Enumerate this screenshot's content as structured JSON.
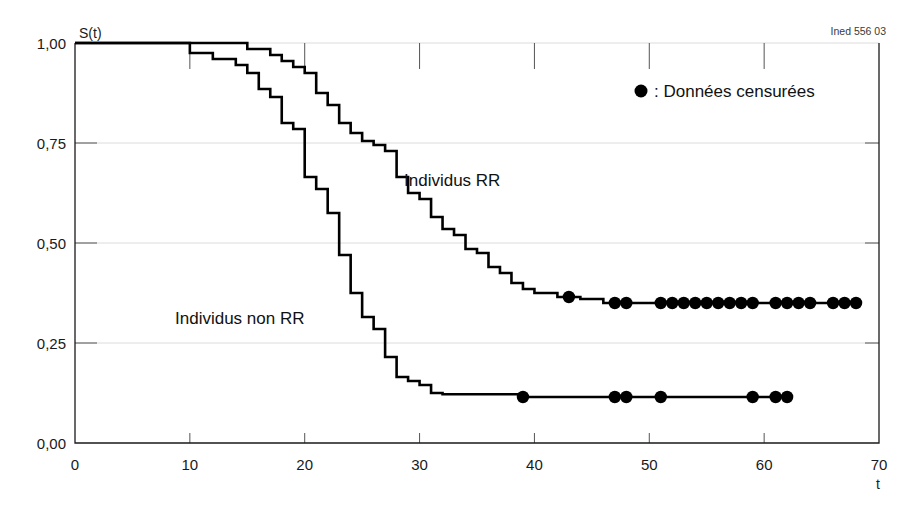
{
  "credit": "Ined 556 03",
  "legend": {
    "marker_icon": "filled-circle-icon",
    "text": ": Données censurées"
  },
  "series_labels": {
    "rr": "Individus RR",
    "non_rr": "Individus non RR"
  },
  "axes": {
    "y_title": "S(t)",
    "x_title": "t",
    "y_ticks": [
      "0,00",
      "0,25",
      "0,50",
      "0,75",
      "1,00"
    ],
    "x_ticks": [
      "0",
      "10",
      "20",
      "30",
      "40",
      "50",
      "60",
      "70"
    ]
  },
  "chart_data": {
    "type": "line",
    "title": "",
    "subtitle": "",
    "xlabel": "t",
    "ylabel": "S(t)",
    "xlim": [
      0,
      70
    ],
    "ylim": [
      0,
      1
    ],
    "grid": true,
    "legend_position": "top-right",
    "annotations": [
      {
        "text": "Individus RR",
        "x": 27.5,
        "y": 0.685
      },
      {
        "text": "Individus non RR",
        "x": 13.5,
        "y": 0.305
      },
      {
        "text": "Ined 556 03",
        "x": 68,
        "y": 1.02
      }
    ],
    "y_tick_values": [
      0,
      0.25,
      0.5,
      0.75,
      1.0
    ],
    "y_tick_labels": [
      "0,00",
      "0,25",
      "0,50",
      "0,75",
      "1,00"
    ],
    "x_tick_values": [
      0,
      10,
      20,
      30,
      40,
      50,
      60,
      70
    ],
    "x_tick_labels": [
      "0",
      "10",
      "20",
      "30",
      "40",
      "50",
      "60",
      "70"
    ],
    "series": [
      {
        "name": "Individus RR",
        "style": "step-post",
        "steps": [
          [
            0,
            1.0
          ],
          [
            15,
            1.0
          ],
          [
            15,
            0.985
          ],
          [
            17,
            0.985
          ],
          [
            17,
            0.97
          ],
          [
            18,
            0.97
          ],
          [
            18,
            0.955
          ],
          [
            19,
            0.955
          ],
          [
            19,
            0.94
          ],
          [
            20,
            0.94
          ],
          [
            20,
            0.925
          ],
          [
            21,
            0.925
          ],
          [
            21,
            0.875
          ],
          [
            22,
            0.875
          ],
          [
            22,
            0.845
          ],
          [
            23,
            0.845
          ],
          [
            23,
            0.8
          ],
          [
            24,
            0.8
          ],
          [
            24,
            0.775
          ],
          [
            25,
            0.775
          ],
          [
            25,
            0.755
          ],
          [
            26,
            0.755
          ],
          [
            26,
            0.745
          ],
          [
            27,
            0.745
          ],
          [
            27,
            0.73
          ],
          [
            28,
            0.73
          ],
          [
            28,
            0.665
          ],
          [
            29,
            0.665
          ],
          [
            29,
            0.625
          ],
          [
            30,
            0.625
          ],
          [
            30,
            0.61
          ],
          [
            31,
            0.61
          ],
          [
            31,
            0.565
          ],
          [
            32,
            0.565
          ],
          [
            32,
            0.535
          ],
          [
            33,
            0.535
          ],
          [
            33,
            0.52
          ],
          [
            34,
            0.52
          ],
          [
            34,
            0.485
          ],
          [
            35,
            0.485
          ],
          [
            35,
            0.475
          ],
          [
            36,
            0.475
          ],
          [
            36,
            0.44
          ],
          [
            37,
            0.44
          ],
          [
            37,
            0.425
          ],
          [
            38,
            0.425
          ],
          [
            38,
            0.4
          ],
          [
            39,
            0.4
          ],
          [
            39,
            0.385
          ],
          [
            40,
            0.385
          ],
          [
            40,
            0.375
          ],
          [
            42,
            0.375
          ],
          [
            42,
            0.365
          ],
          [
            44,
            0.365
          ],
          [
            44,
            0.36
          ],
          [
            46,
            0.36
          ],
          [
            46,
            0.35
          ],
          [
            68,
            0.35
          ]
        ],
        "plateau_value": 0.35,
        "censored_points": [
          [
            43,
            0.365
          ],
          [
            47,
            0.35
          ],
          [
            48,
            0.35
          ],
          [
            51,
            0.35
          ],
          [
            52,
            0.35
          ],
          [
            53,
            0.35
          ],
          [
            54,
            0.35
          ],
          [
            55,
            0.35
          ],
          [
            56,
            0.35
          ],
          [
            57,
            0.35
          ],
          [
            58,
            0.35
          ],
          [
            59,
            0.35
          ],
          [
            61,
            0.35
          ],
          [
            62,
            0.35
          ],
          [
            63,
            0.35
          ],
          [
            64,
            0.35
          ],
          [
            66,
            0.35
          ],
          [
            67,
            0.35
          ],
          [
            68,
            0.35
          ]
        ]
      },
      {
        "name": "Individus non RR",
        "style": "step-post",
        "steps": [
          [
            0,
            1.0
          ],
          [
            10,
            1.0
          ],
          [
            10,
            0.975
          ],
          [
            12,
            0.975
          ],
          [
            12,
            0.96
          ],
          [
            14,
            0.96
          ],
          [
            14,
            0.945
          ],
          [
            15,
            0.945
          ],
          [
            15,
            0.925
          ],
          [
            16,
            0.925
          ],
          [
            16,
            0.885
          ],
          [
            17,
            0.885
          ],
          [
            17,
            0.865
          ],
          [
            18,
            0.865
          ],
          [
            18,
            0.8
          ],
          [
            19,
            0.8
          ],
          [
            19,
            0.785
          ],
          [
            20,
            0.785
          ],
          [
            20,
            0.665
          ],
          [
            21,
            0.665
          ],
          [
            21,
            0.635
          ],
          [
            22,
            0.635
          ],
          [
            22,
            0.575
          ],
          [
            23,
            0.575
          ],
          [
            23,
            0.47
          ],
          [
            24,
            0.47
          ],
          [
            24,
            0.375
          ],
          [
            25,
            0.375
          ],
          [
            25,
            0.315
          ],
          [
            26,
            0.315
          ],
          [
            26,
            0.285
          ],
          [
            27,
            0.285
          ],
          [
            27,
            0.215
          ],
          [
            28,
            0.215
          ],
          [
            28,
            0.165
          ],
          [
            29,
            0.165
          ],
          [
            29,
            0.155
          ],
          [
            30,
            0.155
          ],
          [
            30,
            0.145
          ],
          [
            31,
            0.145
          ],
          [
            31,
            0.125
          ],
          [
            32,
            0.125
          ],
          [
            32,
            0.122
          ],
          [
            39,
            0.122
          ],
          [
            39,
            0.115
          ],
          [
            62,
            0.115
          ]
        ],
        "plateau_value": 0.115,
        "censored_points": [
          [
            39,
            0.115
          ],
          [
            47,
            0.115
          ],
          [
            48,
            0.115
          ],
          [
            51,
            0.115
          ],
          [
            59,
            0.115
          ],
          [
            61,
            0.115
          ],
          [
            62,
            0.115
          ]
        ]
      }
    ]
  }
}
